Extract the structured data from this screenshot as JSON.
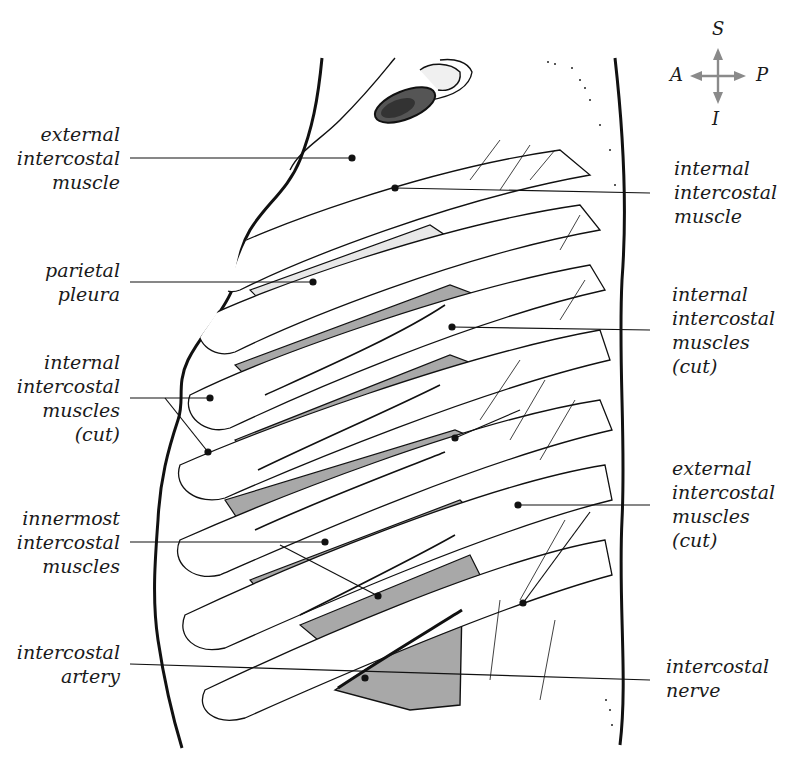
{
  "compass": {
    "superior": "S",
    "inferior": "I",
    "anterior": "A",
    "posterior": "P",
    "arrow_color": "#8a8a8a"
  },
  "labels": {
    "left": [
      {
        "id": "external-intercostal-muscle",
        "lines": [
          "external",
          "intercostal",
          "muscle"
        ]
      },
      {
        "id": "parietal-pleura",
        "lines": [
          "parietal",
          "pleura"
        ]
      },
      {
        "id": "internal-intercostal-muscles-cut-left",
        "lines": [
          "internal",
          "intercostal",
          "muscles",
          "(cut)"
        ]
      },
      {
        "id": "innermost-intercostal-muscles",
        "lines": [
          "innermost",
          "intercostal",
          "muscles"
        ]
      },
      {
        "id": "intercostal-artery",
        "lines": [
          "intercostal",
          "artery"
        ]
      }
    ],
    "right": [
      {
        "id": "internal-intercostal-muscle",
        "lines": [
          "internal",
          "intercostal",
          "muscle"
        ]
      },
      {
        "id": "internal-intercostal-muscles-cut-right",
        "lines": [
          "internal",
          "intercostal",
          "muscles",
          "(cut)"
        ]
      },
      {
        "id": "external-intercostal-muscles-cut",
        "lines": [
          "external",
          "intercostal",
          "muscles",
          "(cut)"
        ]
      },
      {
        "id": "intercostal-nerve",
        "lines": [
          "intercostal",
          "nerve"
        ]
      }
    ]
  },
  "colors": {
    "ink": "#111111",
    "muscle_shade": "#a8a8a8",
    "pleura_shade": "#e6e6e6",
    "background": "#ffffff"
  }
}
